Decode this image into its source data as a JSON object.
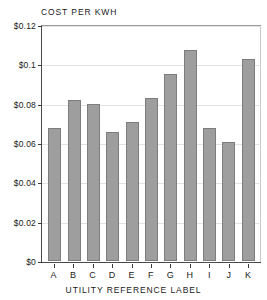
{
  "chart_data": {
    "type": "bar",
    "title": "COST PER KWH",
    "xlabel": "UTILITY REFERENCE LABEL",
    "ylabel": "",
    "categories": [
      "A",
      "B",
      "C",
      "D",
      "E",
      "F",
      "G",
      "H",
      "I",
      "J",
      "K"
    ],
    "values": [
      0.068,
      0.082,
      0.08,
      0.066,
      0.071,
      0.083,
      0.0955,
      0.108,
      0.068,
      0.061,
      0.103
    ],
    "ylim": [
      0,
      0.12
    ],
    "yticks": [
      0,
      0.02,
      0.04,
      0.06,
      0.08,
      0.1,
      0.12
    ],
    "ytick_labels": [
      "$0",
      "$0.02",
      "$0.04",
      "$0.06",
      "$0.08",
      "$0.1",
      "$0.12"
    ],
    "grid": true,
    "legend": null,
    "bar_color": "#9e9e9e",
    "bar_edge_color": "#7d7d7d",
    "axis_color": "#3a3a3a",
    "grid_color": "#e2e2e2",
    "background_color": "#ffffff"
  }
}
